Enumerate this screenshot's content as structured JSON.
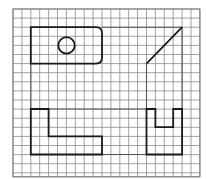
{
  "diagram": {
    "type": "grid-drawing",
    "background": "#ffffff",
    "grid": {
      "origin_x": 13,
      "origin_y": 9,
      "cell_w": 8.9,
      "cell_h": 9.1,
      "cols": 21,
      "rows": 18,
      "line_color": "#8a8a8a",
      "border_color": "#7a7a7a"
    },
    "stroke_color": "#1a1a1a",
    "hidden_line_color": "#555555",
    "shapes": [
      {
        "name": "rounded-rectangle-with-hole",
        "kind": "path",
        "d": "M30.8,27.2 L96,27.2 Q102,27.2 102,33.2 L102,57.6 Q102,63.6 96,63.6 L30.8,63.6 Z"
      },
      {
        "name": "circle-hole",
        "kind": "circle",
        "cx": 66.5,
        "cy": 45.4,
        "r": 8.2
      },
      {
        "name": "side-view-outline",
        "kind": "path",
        "d": "M146.5,63.6 L182.1,27.2"
      },
      {
        "name": "l-shaped-block",
        "kind": "path",
        "d": "M30.8,109 L48.6,109 L48.6,136.3 L102,136.3 L102,154.5 L30.8,154.5 Z"
      },
      {
        "name": "u-shaped-block",
        "kind": "path",
        "d": "M146.5,109 L155.4,109 L155.4,127.2 L173.2,127.2 L173.2,109 L182.1,109 L182.1,154.5 L146.5,154.5 Z"
      }
    ],
    "projection_lines": [
      {
        "name": "top-projection-line",
        "d": "M102,27.2 L182.1,27.2"
      },
      {
        "name": "right-vertical-projection",
        "d": "M182.1,27.2 L182.1,109"
      },
      {
        "name": "middle-vertical-projection",
        "d": "M146.5,63.6 L146.5,109"
      },
      {
        "name": "left-vertical-projection",
        "d": "M30.8,63.6 L30.8,109"
      },
      {
        "name": "upper-horizontal-projection",
        "d": "M48.6,109 L146.5,109"
      },
      {
        "name": "lower-horizontal-projection",
        "d": "M102,154.5 L146.5,154.5"
      }
    ]
  }
}
